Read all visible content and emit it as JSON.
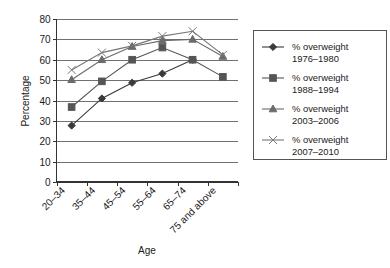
{
  "chart_data": {
    "type": "line",
    "title": "",
    "xlabel": "Age",
    "ylabel": "Percentage",
    "categories": [
      "20–34",
      "35–44",
      "45–54",
      "55–64",
      "65–74",
      "75 and above"
    ],
    "ylim": [
      0,
      80
    ],
    "ytick_labels": [
      "0",
      "10",
      "20",
      "30",
      "40",
      "50",
      "60",
      "70",
      "80"
    ],
    "ytick_values": [
      0,
      10,
      20,
      30,
      40,
      50,
      60,
      70,
      80
    ],
    "grid": "horizontal",
    "legend_position": "right",
    "series": [
      {
        "name": "% overweight 1976–1980",
        "label_line1": "% overweight",
        "label_line2": "1976–1980",
        "marker": "diamond",
        "color": "#3a3a3a",
        "values": [
          27.7,
          41.0,
          48.7,
          53.2,
          60.0,
          null
        ]
      },
      {
        "name": "% overweight 1988–1994",
        "label_line1": "% overweight",
        "label_line2": "1988–1994",
        "marker": "square",
        "color": "#555555",
        "values": [
          36.8,
          49.4,
          60.0,
          66.0,
          60.0,
          51.6
        ]
      },
      {
        "name": "% overweight 2003–2006",
        "label_line1": "% overweight",
        "label_line2": "2003–2006",
        "marker": "triangle",
        "color": "#6b6b6b",
        "values": [
          50.2,
          60.0,
          66.5,
          69.4,
          70.0,
          61.6
        ]
      },
      {
        "name": "% overweight 2007–2010",
        "label_line1": "% overweight",
        "label_line2": "2007–2010",
        "marker": "cross",
        "color": "#777777",
        "values": [
          55.0,
          63.5,
          66.8,
          71.6,
          74.0,
          62.4
        ]
      }
    ]
  }
}
